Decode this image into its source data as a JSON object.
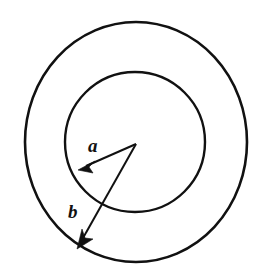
{
  "figure": {
    "title": "Annulus with inner radius a and outer radius b",
    "type": "geometry-diagram",
    "background_color": "#ffffff",
    "stroke_color": "#111111",
    "width": 265,
    "height": 279
  },
  "geometry": {
    "center": {
      "x": 136,
      "y": 143
    },
    "outer_circle": {
      "label": "outer-circle",
      "cx": 136,
      "cy": 142,
      "rx": 111,
      "ry": 120,
      "stroke_width": 2.6
    },
    "inner_circle": {
      "label": "inner-circle",
      "cx": 135,
      "cy": 142,
      "rx": 70,
      "ry": 70,
      "stroke_width": 2.4
    }
  },
  "radii": [
    {
      "name": "a",
      "label": "a",
      "description": "inner radius",
      "from": {
        "x": 136,
        "y": 144
      },
      "to": {
        "x": 80,
        "y": 169
      },
      "label_pos": {
        "x": 88,
        "y": 152
      },
      "label_size": 19
    },
    {
      "name": "b",
      "label": "b",
      "description": "outer radius",
      "from": {
        "x": 136,
        "y": 144
      },
      "to": {
        "x": 78,
        "y": 247
      },
      "label_pos": {
        "x": 68,
        "y": 218
      },
      "label_size": 19
    }
  ]
}
